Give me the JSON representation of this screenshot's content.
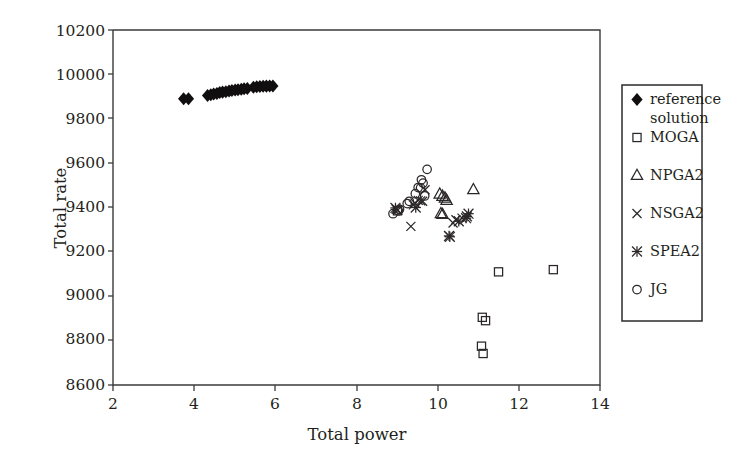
{
  "chart_data": {
    "type": "scatter",
    "title": "",
    "xlabel": "Total power",
    "ylabel": "Total rate",
    "xlim": [
      2,
      14
    ],
    "ylim": [
      8600,
      10200
    ],
    "xticks": [
      2,
      4,
      6,
      8,
      10,
      12,
      14
    ],
    "yticks": [
      8600,
      8800,
      9000,
      9200,
      9400,
      9600,
      9800,
      10000,
      10200
    ],
    "xtick_labels": [
      "2",
      "4",
      "6",
      "8",
      "10",
      "12",
      "14"
    ],
    "ytick_labels": [
      "8600",
      "8800",
      "9000",
      "9200",
      "9400",
      "9600",
      "9800",
      "10000",
      "10200"
    ],
    "grid": false,
    "legend_position": "outside-right",
    "series": [
      {
        "name": "reference solution",
        "marker": "filled-diamond",
        "color": "#100e0e",
        "points": [
          [
            3.74,
            9890
          ],
          [
            3.86,
            9890
          ],
          [
            4.33,
            9905
          ],
          [
            4.41,
            9908
          ],
          [
            4.48,
            9912
          ],
          [
            4.56,
            9914
          ],
          [
            4.63,
            9918
          ],
          [
            4.7,
            9920
          ],
          [
            4.78,
            9922
          ],
          [
            4.86,
            9925
          ],
          [
            4.93,
            9927
          ],
          [
            5.01,
            9930
          ],
          [
            5.08,
            9931
          ],
          [
            5.16,
            9933
          ],
          [
            5.23,
            9935
          ],
          [
            5.31,
            9936
          ],
          [
            5.46,
            9942
          ],
          [
            5.54,
            9944
          ],
          [
            5.62,
            9945
          ],
          [
            5.7,
            9946
          ],
          [
            5.78,
            9947
          ],
          [
            5.86,
            9948
          ],
          [
            5.94,
            9948
          ]
        ]
      },
      {
        "name": "MOGA",
        "marker": "open-square",
        "color": "#2b2728",
        "points": [
          [
            9.01,
            9385
          ],
          [
            11.5,
            9110
          ],
          [
            12.85,
            9120
          ],
          [
            11.1,
            8905
          ],
          [
            11.18,
            8890
          ],
          [
            11.08,
            8775
          ],
          [
            11.12,
            8742
          ]
        ]
      },
      {
        "name": "NPGA2",
        "marker": "open-triangle",
        "color": "#2b2728",
        "points": [
          [
            10.05,
            9460
          ],
          [
            10.12,
            9450
          ],
          [
            10.18,
            9442
          ],
          [
            10.22,
            9432
          ],
          [
            10.08,
            9372
          ],
          [
            10.12,
            9368
          ],
          [
            10.88,
            9480
          ]
        ]
      },
      {
        "name": "NSGA2",
        "marker": "cross-x",
        "color": "#2b2728",
        "points": [
          [
            9.69,
            9480
          ],
          [
            9.52,
            9432
          ],
          [
            9.58,
            9430
          ],
          [
            9.63,
            9428
          ],
          [
            9.44,
            9420
          ],
          [
            9.4,
            9412
          ],
          [
            9.34,
            9315
          ],
          [
            10.45,
            9345
          ],
          [
            10.6,
            9352
          ],
          [
            10.38,
            9330
          ],
          [
            8.98,
            9392
          ],
          [
            9.02,
            9388
          ]
        ]
      },
      {
        "name": "SPEA2",
        "marker": "asterisk",
        "color": "#2b2728",
        "points": [
          [
            9.46,
            9400
          ],
          [
            10.72,
            9360
          ],
          [
            10.76,
            9372
          ],
          [
            10.7,
            9352
          ],
          [
            10.52,
            9338
          ],
          [
            8.96,
            9398
          ],
          [
            10.28,
            9272
          ],
          [
            10.3,
            9268
          ]
        ]
      },
      {
        "name": "JG",
        "marker": "open-circle",
        "color": "#2b2728",
        "points": [
          [
            9.74,
            9572
          ],
          [
            9.6,
            9525
          ],
          [
            9.64,
            9510
          ],
          [
            9.52,
            9490
          ],
          [
            9.58,
            9488
          ],
          [
            9.45,
            9462
          ],
          [
            9.3,
            9428
          ],
          [
            9.25,
            9418
          ],
          [
            9.06,
            9392
          ],
          [
            9.03,
            9385
          ],
          [
            8.9,
            9372
          ],
          [
            9.68,
            9452
          ]
        ]
      }
    ]
  },
  "legend": {
    "entries": [
      {
        "label": "reference",
        "label2": "solution",
        "marker": "filled-diamond"
      },
      {
        "label": "MOGA",
        "marker": "open-square"
      },
      {
        "label": "NPGA2",
        "marker": "open-triangle"
      },
      {
        "label": "NSGA2",
        "marker": "cross-x"
      },
      {
        "label": "SPEA2",
        "marker": "asterisk"
      },
      {
        "label": "JG",
        "marker": "open-circle"
      }
    ]
  }
}
